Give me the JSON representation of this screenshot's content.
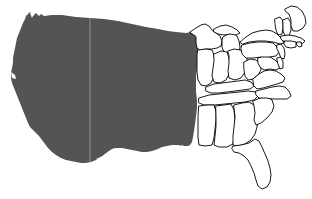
{
  "figure": {
    "caption": "",
    "width": 312,
    "height": 199,
    "background_color": "#ffffff",
    "fill_color": "#555355",
    "outline_color": "#000000",
    "outline_fill_color": "#ffffff",
    "seam_artifact_x": 89
  },
  "legend": {
    "shaded_label": "",
    "outline_label": ""
  },
  "map_data": {
    "type": "choropleth-binary",
    "shaded_region_name": "western-and-central-states",
    "outlined_region_name": "eastern-states",
    "shaded_states": [
      "Washington",
      "Oregon",
      "California",
      "Idaho",
      "Nevada",
      "Utah",
      "Arizona",
      "Montana",
      "Wyoming",
      "Colorado",
      "New Mexico",
      "North Dakota",
      "South Dakota",
      "Nebraska",
      "Kansas",
      "Oklahoma",
      "Texas",
      "Minnesota",
      "Iowa",
      "Missouri",
      "Arkansas",
      "Louisiana"
    ],
    "outlined_states": [
      "Wisconsin",
      "Michigan",
      "Illinois",
      "Indiana",
      "Ohio",
      "Kentucky",
      "Tennessee",
      "Mississippi",
      "Alabama",
      "Georgia",
      "Florida",
      "South Carolina",
      "North Carolina",
      "Virginia",
      "West Virginia",
      "Maryland",
      "Delaware",
      "Pennsylvania",
      "New Jersey",
      "New York",
      "Connecticut",
      "Rhode Island",
      "Massachusetts",
      "Vermont",
      "New Hampshire",
      "Maine"
    ]
  }
}
